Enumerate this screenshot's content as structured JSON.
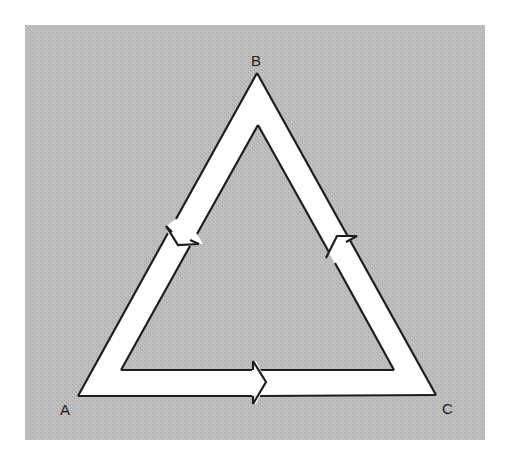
{
  "diagram": {
    "type": "cycle",
    "background_color": "#b9b9b9",
    "band_color": "#ffffff",
    "stroke_color": "#1e1e1e",
    "vertices": [
      {
        "id": "A",
        "label": "A"
      },
      {
        "id": "B",
        "label": "B"
      },
      {
        "id": "C",
        "label": "C"
      }
    ],
    "edges": [
      {
        "from": "B",
        "to": "A",
        "direction": "down-left"
      },
      {
        "from": "A",
        "to": "C",
        "direction": "right"
      },
      {
        "from": "C",
        "to": "B",
        "direction": "up-left"
      }
    ]
  }
}
